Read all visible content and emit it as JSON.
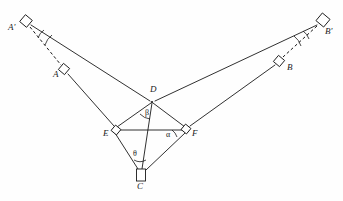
{
  "figure": {
    "canvas": {
      "width": 343,
      "height": 201,
      "background": "#fefefe"
    },
    "stroke_color": "#1a1a1a",
    "stations": [
      {
        "id": "A-prime",
        "label": "A'",
        "x": 26,
        "y": 21,
        "label_x": 9,
        "label_y": 25,
        "marker": "rotated-square",
        "size": 9,
        "rotation": 40
      },
      {
        "id": "A",
        "label": "A",
        "x": 64,
        "y": 69,
        "label_x": 54,
        "label_y": 72,
        "marker": "rotated-square",
        "size": 8,
        "rotation": 40
      },
      {
        "id": "B-prime",
        "label": "B'",
        "x": 323,
        "y": 20,
        "label_x": 326,
        "label_y": 29,
        "marker": "rotated-square",
        "size": 10,
        "rotation": 40
      },
      {
        "id": "B",
        "label": "B",
        "x": 279,
        "y": 61,
        "label_x": 287,
        "label_y": 66,
        "marker": "rotated-square",
        "size": 8,
        "rotation": 40
      },
      {
        "id": "D",
        "label": "D",
        "x": 152,
        "y": 102,
        "label_x": 152,
        "label_y": 87,
        "marker": "vertex",
        "size": 0,
        "rotation": 0
      },
      {
        "id": "E",
        "label": "E",
        "x": 116,
        "y": 130,
        "label_x": 104,
        "label_y": 132,
        "marker": "rotated-square",
        "size": 7,
        "rotation": 40
      },
      {
        "id": "F",
        "label": "F",
        "x": 186,
        "y": 129,
        "label_x": 192,
        "label_y": 132,
        "marker": "rotated-square",
        "size": 7,
        "rotation": 40
      },
      {
        "id": "C",
        "label": "C",
        "x": 141,
        "y": 175,
        "label_x": 137,
        "label_y": 185,
        "marker": "upright-square",
        "size": 9,
        "rotation": 0
      }
    ],
    "angles": [
      {
        "id": "beta",
        "label": "β",
        "vertex": "D",
        "label_x": 146,
        "label_y": 112,
        "arc": "D-E to D-C"
      },
      {
        "id": "alpha",
        "label": "α",
        "vertex": "F",
        "label_x": 167,
        "label_y": 133,
        "arc": "F-E to F-D"
      },
      {
        "id": "theta",
        "label": "θ",
        "vertex": "C",
        "label_x": 134,
        "label_y": 153,
        "arc": "C-E to C-F"
      }
    ],
    "solid_lines": [
      {
        "id": "Aprime-D",
        "from": "A-prime",
        "to": "D"
      },
      {
        "id": "Bprime-D",
        "from": "B-prime",
        "to": "D"
      },
      {
        "id": "A-E",
        "from": "A",
        "to": "E"
      },
      {
        "id": "E-C",
        "from": "E",
        "to": "C"
      },
      {
        "id": "B-F",
        "from": "B",
        "to": "F"
      },
      {
        "id": "F-C",
        "from": "F",
        "to": "C"
      },
      {
        "id": "D-E",
        "from": "D",
        "to": "E"
      },
      {
        "id": "D-F",
        "from": "D",
        "to": "F"
      },
      {
        "id": "D-C",
        "from": "D",
        "to": "C"
      },
      {
        "id": "E-F",
        "from": "E",
        "to": "F"
      }
    ],
    "dashed_lines": [
      {
        "id": "Aprime-A",
        "from": "A-prime",
        "to": "A"
      },
      {
        "id": "Bprime-B",
        "from": "B-prime",
        "to": "B"
      }
    ],
    "background_text": {
      "left": " ",
      "right": " "
    }
  }
}
